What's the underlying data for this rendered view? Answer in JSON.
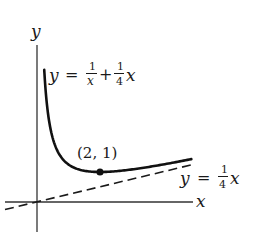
{
  "figure": {
    "axes": {
      "x_label": "x",
      "y_label": "y",
      "origin_px": [
        37,
        202
      ],
      "unit_px": [
        31.5,
        30
      ]
    },
    "curve": {
      "name": "y = 1/x + 1/4 x",
      "label_lhs": "y",
      "label_eq": "=",
      "frac1_num": "1",
      "frac1_den": "x",
      "plus": "+",
      "frac2_num": "1",
      "frac2_den": "4",
      "frac2_var": "x",
      "x_range": [
        0.23,
        4.9
      ]
    },
    "asymptote": {
      "name": "y = 1/4 x",
      "label_lhs": "y",
      "label_eq": "=",
      "frac_num": "1",
      "frac_den": "4",
      "frac_var": "x",
      "x_range": [
        -1.0,
        4.85
      ]
    },
    "point": {
      "label": "(2, 1)",
      "x": 2,
      "y": 1
    },
    "colors": {
      "stroke": "#1a1a1a",
      "axis": "#333333",
      "background": "#ffffff"
    }
  }
}
